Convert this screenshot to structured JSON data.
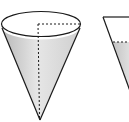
{
  "diagram": {
    "colors": {
      "outline": "#1a1a1a",
      "fill_light": "#f2f2f2",
      "fill_dark": "#bdbdbd",
      "background": "#ffffff"
    },
    "left_cone": {
      "label": "",
      "radius_dashed": true,
      "height_dashed": true
    },
    "right_cone": {
      "label": "",
      "liquid_level_dashed": true,
      "partially_cropped": true
    }
  }
}
